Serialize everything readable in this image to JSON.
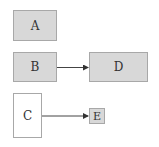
{
  "diagram": {
    "nodes": [
      {
        "id": "A",
        "label": "A",
        "fill": "#d8d8d8",
        "x": 13,
        "y": 10,
        "w": 44,
        "h": 31
      },
      {
        "id": "B",
        "label": "B",
        "fill": "#d8d8d8",
        "x": 13,
        "y": 52,
        "w": 44,
        "h": 30
      },
      {
        "id": "D",
        "label": "D",
        "fill": "#d8d8d8",
        "x": 89,
        "y": 52,
        "w": 59,
        "h": 30
      },
      {
        "id": "C",
        "label": "C",
        "fill": "#ffffff",
        "x": 13,
        "y": 93,
        "w": 29,
        "h": 45
      },
      {
        "id": "E",
        "label": "E",
        "fill": "#d8d8d8",
        "x": 89,
        "y": 108,
        "w": 16,
        "h": 16
      }
    ],
    "edges": [
      {
        "from": "B",
        "to": "D"
      },
      {
        "from": "C",
        "to": "E"
      }
    ],
    "colors": {
      "node_fill": "#d8d8d8",
      "border": "#a8a8a8",
      "edge": "#444444"
    }
  }
}
